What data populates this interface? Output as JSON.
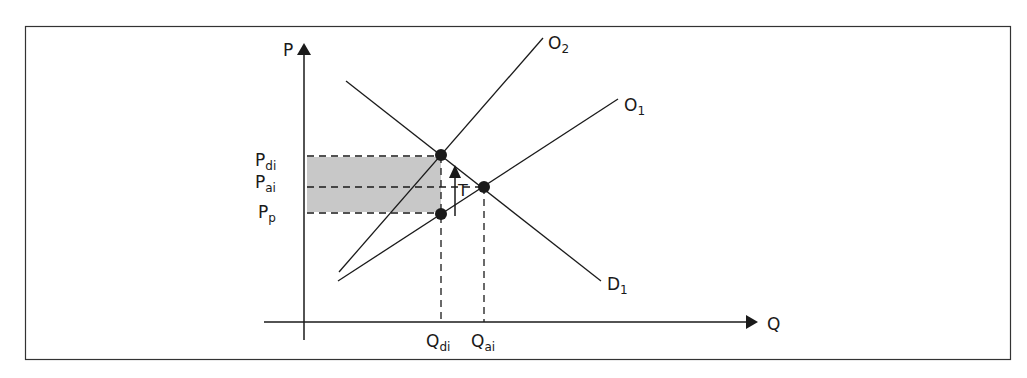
{
  "diagram": {
    "type": "supply-demand-tariff",
    "axes": {
      "y_label": "P",
      "x_label": "Q"
    },
    "curves": [
      {
        "id": "O2",
        "label_main": "O",
        "label_sub": "2",
        "kind": "supply"
      },
      {
        "id": "O1",
        "label_main": "O",
        "label_sub": "1",
        "kind": "supply"
      },
      {
        "id": "D1",
        "label_main": "D",
        "label_sub": "1",
        "kind": "demand"
      }
    ],
    "price_levels": [
      {
        "id": "Pdi",
        "label_main": "P",
        "label_sub": "di"
      },
      {
        "id": "Pai",
        "label_main": "P",
        "label_sub": "ai"
      },
      {
        "id": "Pp",
        "label_main": "P",
        "label_sub": "p"
      }
    ],
    "quantity_levels": [
      {
        "id": "Qdi",
        "label_main": "Q",
        "label_sub": "di"
      },
      {
        "id": "Qai",
        "label_main": "Q",
        "label_sub": "ai"
      }
    ],
    "tariff_label": "T",
    "colors": {
      "line": "#1a1a1a",
      "shade": "#c8c8c8",
      "border": "#333333"
    }
  }
}
